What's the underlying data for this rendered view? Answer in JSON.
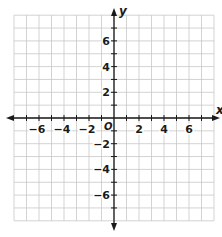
{
  "diagram": {
    "type": "coordinate-plane",
    "x_axis_label": "x",
    "y_axis_label": "y",
    "origin_label": "O",
    "x_range": [
      -8,
      8
    ],
    "y_range": [
      -8,
      8
    ],
    "grid_step": 1,
    "tick_label_step": 2,
    "x_tick_labels": [
      "−6",
      "−4",
      "−2",
      "2",
      "4",
      "6"
    ],
    "x_tick_values": [
      -6,
      -4,
      -2,
      2,
      4,
      6
    ],
    "y_tick_labels": [
      "6",
      "4",
      "2",
      "−2",
      "−4",
      "−6"
    ],
    "y_tick_values": [
      6,
      4,
      2,
      -2,
      -4,
      -6
    ],
    "colors": {
      "grid": "#c8c8c8",
      "axis": "#1a1a1a",
      "text": "#1a1a1a",
      "background": "#ffffff"
    }
  }
}
